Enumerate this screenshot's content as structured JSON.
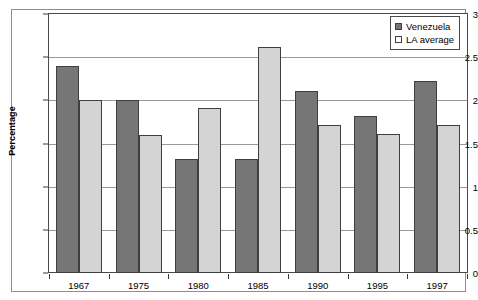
{
  "chart_data": {
    "type": "bar",
    "title": "",
    "xlabel": "",
    "ylabel": "Percentage",
    "categories": [
      "1967",
      "1975",
      "1980",
      "1985",
      "1990",
      "1995",
      "1997"
    ],
    "series": [
      {
        "name": "Venezuela",
        "color": "#767676",
        "values": [
          2.4,
          2.0,
          1.32,
          1.32,
          2.11,
          1.82,
          2.22
        ]
      },
      {
        "name": "LA average",
        "color": "#d4d4d4",
        "values": [
          2.0,
          1.6,
          1.91,
          2.62,
          1.72,
          1.61,
          1.72
        ]
      }
    ],
    "ylim": [
      0,
      3
    ],
    "ytick_values": [
      0,
      0.5,
      1,
      1.5,
      2,
      2.5,
      3
    ],
    "ytick_labels": [
      "0",
      "0.5",
      "1",
      "1.5",
      "2",
      "2.5",
      "3"
    ],
    "grid": true,
    "grid_axis": "y",
    "legend_position": "top-right"
  }
}
